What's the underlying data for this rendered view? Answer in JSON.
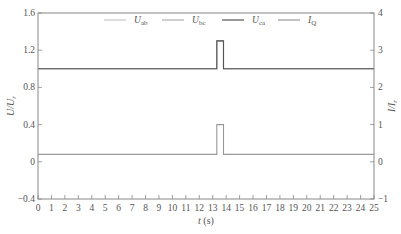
{
  "chart_data": {
    "type": "line",
    "title": "",
    "xlabel": "t (s)",
    "ylabel_left": "U/U_r",
    "ylabel_right": "I/I_r",
    "xlim": [
      0,
      25
    ],
    "ylim_left": [
      -0.4,
      1.6
    ],
    "ylim_right": [
      -1,
      4
    ],
    "x_ticks": [
      "0",
      "1",
      "2",
      "3",
      "4",
      "5",
      "6",
      "7",
      "8",
      "9",
      "10",
      "11",
      "12",
      "13",
      "14",
      "15",
      "16",
      "17",
      "18",
      "19",
      "20",
      "21",
      "22",
      "23",
      "24",
      "25"
    ],
    "y_ticks_left": [
      "1.6",
      "1.2",
      "0.8",
      "0.4",
      "0",
      "-0.4"
    ],
    "y_ticks_right": [
      "4",
      "3",
      "2",
      "1",
      "0",
      "-1"
    ],
    "grid": false,
    "legend_position": "top-center",
    "legend": [
      "U_ab",
      "U_bc",
      "U_ca",
      "I_Q"
    ],
    "series": [
      {
        "name": "U_ab",
        "axis": "left",
        "color": "#c8c8c8",
        "x": [
          0,
          13.3,
          13.3,
          13.8,
          13.8,
          25
        ],
        "y": [
          1.0,
          1.0,
          1.3,
          1.3,
          1.0,
          1.0
        ]
      },
      {
        "name": "U_bc",
        "axis": "left",
        "color": "#b0b0b0",
        "x": [
          0,
          13.3,
          13.3,
          13.8,
          13.8,
          25
        ],
        "y": [
          1.0,
          1.0,
          1.3,
          1.3,
          1.0,
          1.0
        ]
      },
      {
        "name": "U_ca",
        "axis": "left",
        "color": "#555555",
        "x": [
          0,
          13.3,
          13.3,
          13.8,
          13.8,
          25
        ],
        "y": [
          1.0,
          1.0,
          1.3,
          1.3,
          1.0,
          1.0
        ]
      },
      {
        "name": "I_Q",
        "axis": "right",
        "color": "#999999",
        "x": [
          0,
          13.3,
          13.3,
          13.8,
          13.8,
          25
        ],
        "y": [
          0.2,
          0.2,
          1.0,
          1.0,
          0.2,
          0.2
        ]
      }
    ]
  },
  "legend_labels": [
    {
      "main": "U",
      "sub": "ab"
    },
    {
      "main": "U",
      "sub": "bc"
    },
    {
      "main": "U",
      "sub": "ca"
    },
    {
      "main": "I",
      "sub": "Q"
    }
  ],
  "axis_labels": {
    "x_main": "t",
    "x_unit": " (s)",
    "left_main": "U/U",
    "left_sub": "r",
    "right_main": "I/I",
    "right_sub": "r"
  }
}
